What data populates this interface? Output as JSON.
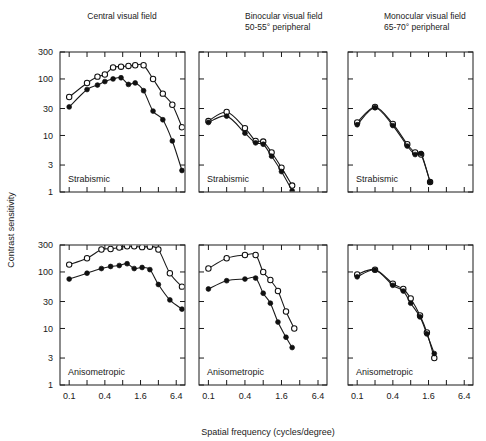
{
  "figure": {
    "y_axis_label": "Contrast sensitivity",
    "x_axis_label": "Spatial frequency (cycles/degree)",
    "column_titles": [
      {
        "line1": "Central visual field",
        "line2": ""
      },
      {
        "line1": "Binocular visual field",
        "line2": "50-55° peripheral"
      },
      {
        "line1": "Monocular visual field",
        "line2": "65-70° peripheral"
      }
    ],
    "row_labels": [
      "Strabismic",
      "Anisometropic"
    ],
    "y_ticks": [
      "300",
      "100",
      "30",
      "10",
      "3",
      "1"
    ],
    "x_ticks": [
      "0.1",
      "0.4",
      "1.6",
      "6.4"
    ],
    "legend": {
      "open_symbol": "open-circle",
      "filled_symbol": "filled-circle"
    },
    "colors": {
      "ink": "#1a1a1a",
      "background": "#ffffff"
    }
  },
  "chart_data": [
    {
      "id": "strabismic-central",
      "type": "scatter",
      "title": "Central visual field",
      "panel_label": "Strabismic",
      "xlabel": "Spatial frequency (cycles/degree)",
      "ylabel": "Contrast sensitivity",
      "xscale": "log",
      "yscale": "log",
      "xlim": [
        0.07,
        9.0
      ],
      "ylim": [
        1,
        300
      ],
      "xticks": [
        0.1,
        0.4,
        1.6,
        6.4
      ],
      "yticks": [
        1,
        3,
        10,
        30,
        100,
        300
      ],
      "grid": false,
      "series": [
        {
          "name": "open-circle",
          "marker": "open",
          "x": [
            0.1,
            0.2,
            0.3,
            0.4,
            0.55,
            0.75,
            1.0,
            1.3,
            1.8,
            2.6,
            3.8,
            5.5,
            8.0
          ],
          "y": [
            48,
            85,
            110,
            120,
            160,
            165,
            170,
            175,
            175,
            100,
            55,
            35,
            14
          ]
        },
        {
          "name": "filled-circle",
          "marker": "filled",
          "x": [
            0.1,
            0.2,
            0.3,
            0.4,
            0.55,
            0.75,
            1.0,
            1.3,
            1.8,
            2.6,
            3.8,
            5.5,
            8.0
          ],
          "y": [
            32,
            65,
            78,
            90,
            100,
            105,
            80,
            85,
            62,
            27,
            19,
            8,
            2.4
          ]
        }
      ]
    },
    {
      "id": "strabismic-binocular",
      "type": "scatter",
      "title": "Binocular visual field 50-55° peripheral",
      "panel_label": "Strabismic",
      "xscale": "log",
      "yscale": "log",
      "xlim": [
        0.07,
        9.0
      ],
      "ylim": [
        1,
        300
      ],
      "xticks": [
        0.1,
        0.4,
        1.6,
        6.4
      ],
      "yticks": [
        1,
        3,
        10,
        30,
        100,
        300
      ],
      "grid": false,
      "series": [
        {
          "name": "open-circle",
          "marker": "open",
          "x": [
            0.1,
            0.2,
            0.4,
            0.6,
            0.8,
            1.1,
            1.6,
            2.4
          ],
          "y": [
            18,
            26,
            13.5,
            8.0,
            7.8,
            5.0,
            2.7,
            1.3
          ]
        },
        {
          "name": "filled-circle",
          "marker": "filled",
          "x": [
            0.1,
            0.2,
            0.4,
            0.6,
            0.8,
            1.1,
            1.6,
            2.4
          ],
          "y": [
            17,
            22,
            11.0,
            7.4,
            7.0,
            4.3,
            2.3,
            1.05
          ]
        }
      ]
    },
    {
      "id": "strabismic-monocular",
      "type": "scatter",
      "title": "Monocular visual field 65-70° peripheral",
      "panel_label": "Strabismic",
      "xscale": "log",
      "yscale": "log",
      "xlim": [
        0.07,
        9.0
      ],
      "ylim": [
        1,
        300
      ],
      "xticks": [
        0.1,
        0.4,
        1.6,
        6.4
      ],
      "yticks": [
        1,
        3,
        10,
        30,
        100,
        300
      ],
      "grid": false,
      "series": [
        {
          "name": "open-circle",
          "marker": "open",
          "x": [
            0.1,
            0.2,
            0.4,
            0.7,
            0.95,
            1.2,
            1.7
          ],
          "y": [
            17,
            32,
            16,
            7.0,
            5.0,
            4.6,
            1.5
          ]
        },
        {
          "name": "filled-circle",
          "marker": "filled",
          "x": [
            0.1,
            0.2,
            0.4,
            0.7,
            0.95,
            1.2,
            1.7
          ],
          "y": [
            15.5,
            31,
            15,
            6.5,
            4.6,
            4.8,
            1.5
          ]
        }
      ]
    },
    {
      "id": "anisometropic-central",
      "type": "scatter",
      "title": "Central visual field",
      "panel_label": "Anisometropic",
      "xscale": "log",
      "yscale": "log",
      "xlim": [
        0.07,
        9.0
      ],
      "ylim": [
        1,
        300
      ],
      "xticks": [
        0.1,
        0.4,
        1.6,
        6.4
      ],
      "yticks": [
        1,
        3,
        10,
        30,
        100,
        300
      ],
      "grid": false,
      "series": [
        {
          "name": "open-circle",
          "marker": "open",
          "x": [
            0.1,
            0.2,
            0.35,
            0.5,
            0.7,
            0.95,
            1.25,
            1.7,
            2.3,
            3.2,
            5.0,
            8.0
          ],
          "y": [
            135,
            175,
            250,
            255,
            270,
            285,
            285,
            275,
            280,
            250,
            95,
            55
          ]
        },
        {
          "name": "filled-circle",
          "marker": "filled",
          "x": [
            0.1,
            0.2,
            0.35,
            0.5,
            0.7,
            0.95,
            1.25,
            1.7,
            2.3,
            3.2,
            5.0,
            8.0
          ],
          "y": [
            75,
            95,
            115,
            125,
            130,
            140,
            115,
            120,
            110,
            60,
            32,
            22
          ]
        }
      ]
    },
    {
      "id": "anisometropic-binocular",
      "type": "scatter",
      "title": "Binocular visual field 50-55° peripheral",
      "panel_label": "Anisometropic",
      "xscale": "log",
      "yscale": "log",
      "xlim": [
        0.07,
        9.0
      ],
      "ylim": [
        1,
        300
      ],
      "xticks": [
        0.1,
        0.4,
        1.6,
        6.4
      ],
      "yticks": [
        1,
        3,
        10,
        30,
        100,
        300
      ],
      "grid": false,
      "series": [
        {
          "name": "open-circle",
          "marker": "open",
          "x": [
            0.1,
            0.2,
            0.4,
            0.6,
            0.8,
            1.05,
            1.4,
            1.9,
            2.6
          ],
          "y": [
            115,
            175,
            200,
            200,
            100,
            72,
            46,
            20,
            10
          ]
        },
        {
          "name": "filled-circle",
          "marker": "filled",
          "x": [
            0.1,
            0.2,
            0.4,
            0.6,
            0.8,
            1.05,
            1.4,
            1.9,
            2.4
          ],
          "y": [
            50,
            70,
            75,
            78,
            42,
            28,
            13,
            7.0,
            4.6
          ]
        }
      ]
    },
    {
      "id": "anisometropic-monocular",
      "type": "scatter",
      "title": "Monocular visual field 65-70° peripheral",
      "panel_label": "Anisometropic",
      "xscale": "log",
      "yscale": "log",
      "xlim": [
        0.07,
        9.0
      ],
      "ylim": [
        1,
        300
      ],
      "xticks": [
        0.1,
        0.4,
        1.6,
        6.4
      ],
      "yticks": [
        1,
        3,
        10,
        30,
        100,
        300
      ],
      "grid": false,
      "series": [
        {
          "name": "open-circle",
          "marker": "open",
          "x": [
            0.1,
            0.2,
            0.4,
            0.6,
            0.8,
            1.15,
            1.5,
            2.0
          ],
          "y": [
            90,
            110,
            62,
            50,
            34,
            17,
            8.5,
            3.0
          ]
        },
        {
          "name": "filled-circle",
          "marker": "filled",
          "x": [
            0.1,
            0.2,
            0.4,
            0.6,
            0.8,
            1.15,
            1.5,
            2.0
          ],
          "y": [
            82,
            108,
            58,
            46,
            28,
            16,
            8.0,
            3.6
          ]
        }
      ]
    }
  ]
}
